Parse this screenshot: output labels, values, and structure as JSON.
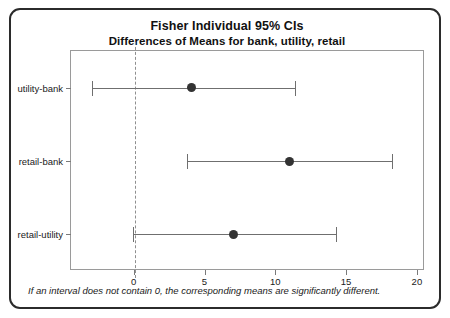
{
  "chart_data": {
    "type": "scatter",
    "title": "Fisher Individual 95% CIs",
    "subtitle": "Differences of Means for bank, utility, retail",
    "xlabel": "",
    "ylabel": "",
    "xlim": [
      -4.5,
      20.5
    ],
    "xticks": [
      0,
      5,
      10,
      15,
      20
    ],
    "xtick_labels": [
      "0",
      "5",
      "10",
      "15",
      "20"
    ],
    "categories": [
      "utility-bank",
      "retail-bank",
      "retail-utility"
    ],
    "grid": false,
    "legend": "none",
    "reference_line": {
      "value": 0,
      "style": "dashed",
      "color": "#8f8f8f"
    },
    "marker_color": "#333333",
    "line_color": "#6f6f6f",
    "series": [
      {
        "name": "utility-bank",
        "center": 4.0,
        "lower": -3.0,
        "upper": 11.3,
        "contains_zero": true
      },
      {
        "name": "retail-bank",
        "center": 10.9,
        "lower": 3.7,
        "upper": 18.2,
        "contains_zero": false
      },
      {
        "name": "retail-utility",
        "center": 7.0,
        "lower": -0.1,
        "upper": 14.2,
        "contains_zero": true
      }
    ],
    "footnote": "If an interval does not contain 0, the corresponding means are significantly different."
  }
}
